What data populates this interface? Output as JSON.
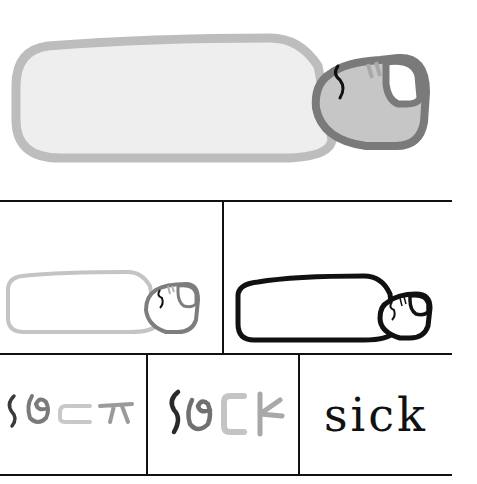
{
  "diagram": {
    "top_panel": {
      "label": "pictograph-colored",
      "body_fill": "#eeeeee",
      "body_stroke": "#bdbdbd",
      "head_fill": "#c6c6c6",
      "head_stroke": "#7a7a7a",
      "eye_fill": "#ffffff",
      "mark_color": "#111111"
    },
    "middle_row": [
      {
        "label": "gray-outline-pictograph",
        "body_stroke": "#c4c4c4",
        "head_stroke": "#7d7d7d"
      },
      {
        "label": "black-outline-pictograph",
        "stroke": "#111111"
      }
    ],
    "bottom_row": [
      {
        "label": "glyph-step-1",
        "colors": [
          "#3a3a3a",
          "#7a7a7a",
          "#c8c8c8",
          "#9a9a9a"
        ]
      },
      {
        "label": "glyph-step-2",
        "colors": [
          "#2a2a2a",
          "#707070",
          "#c4c4c4",
          "#a8a8a8"
        ]
      },
      {
        "label": "final-word",
        "text": "sick"
      }
    ],
    "grid_color": "#111111"
  }
}
